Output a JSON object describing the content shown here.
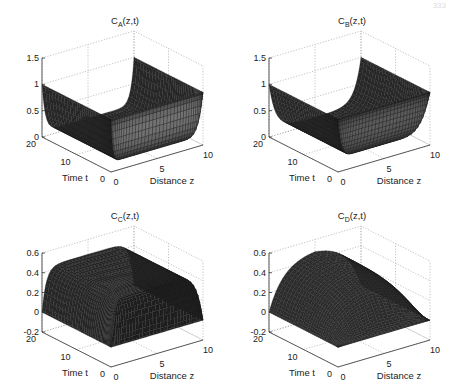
{
  "figure": {
    "page_number_fragment": "333"
  },
  "chart_data": [
    {
      "type": "surface3d",
      "panel": "A",
      "title": "C_A(z,t)",
      "title_main": "C",
      "title_sub": "A",
      "title_rest": "(z,t)",
      "xlabel": "Distance z",
      "ylabel": "Time t",
      "zlabel": "",
      "x_ticks": [
        0,
        5,
        10
      ],
      "y_ticks": [
        0,
        10,
        20
      ],
      "z_ticks": [
        "0",
        "0.5",
        "1",
        "1.5"
      ],
      "zlim": [
        0,
        1.5
      ],
      "xlim": [
        0,
        10
      ],
      "ylim": [
        0,
        20
      ],
      "grid": true,
      "description": "Boundary value 1 at t=0 edges; surface drops quickly to ~0.1 plateau in interior",
      "samples": {
        "boundary": 1.0,
        "interior": 0.1
      }
    },
    {
      "type": "surface3d",
      "panel": "B",
      "title": "C_B(z,t)",
      "title_main": "C",
      "title_sub": "B",
      "title_rest": "(z,t)",
      "xlabel": "Distance z",
      "ylabel": "Time t",
      "zlabel": "",
      "x_ticks": [
        0,
        5,
        10
      ],
      "y_ticks": [
        0,
        10,
        20
      ],
      "z_ticks": [
        "0",
        "0.5",
        "1",
        "1.5"
      ],
      "zlim": [
        0,
        1.5
      ],
      "xlim": [
        0,
        10
      ],
      "ylim": [
        0,
        20
      ],
      "grid": true,
      "description": "Boundary value 1; smoother decay toward ~0.1 interior plateau",
      "samples": {
        "boundary": 1.0,
        "interior": 0.12
      }
    },
    {
      "type": "surface3d",
      "panel": "C",
      "title": "C_C(z,t)",
      "title_main": "C",
      "title_sub": "C",
      "title_rest": "(z,t)",
      "xlabel": "Distance z",
      "ylabel": "Time t",
      "zlabel": "",
      "x_ticks": [
        0,
        5,
        10
      ],
      "y_ticks": [
        0,
        10,
        20
      ],
      "z_ticks": [
        "-0.2",
        "0",
        "0.2",
        "0.4",
        "0.6"
      ],
      "zlim": [
        -0.2,
        0.6
      ],
      "xlim": [
        0,
        10
      ],
      "ylim": [
        0,
        20
      ],
      "grid": true,
      "description": "Boundary value 0; quickly rises to ~0.45 plateau in interior",
      "samples": {
        "boundary": 0.0,
        "interior": 0.45
      }
    },
    {
      "type": "surface3d",
      "panel": "D",
      "title": "C_D(z,t)",
      "title_main": "C",
      "title_sub": "D",
      "title_rest": "(z,t)",
      "xlabel": "Distance z",
      "ylabel": "Time t",
      "zlabel": "",
      "x_ticks": [
        0,
        5,
        10
      ],
      "y_ticks": [
        0,
        10,
        20
      ],
      "z_ticks": [
        "-0.2",
        "0",
        "0.2",
        "0.4",
        "0.6"
      ],
      "zlim": [
        -0.2,
        0.6
      ],
      "xlim": [
        0,
        10
      ],
      "ylim": [
        0,
        20
      ],
      "grid": true,
      "description": "Boundary value 0; gradual dome rising to ~0.5 at center",
      "samples": {
        "boundary": 0.0,
        "interior": 0.5
      }
    }
  ]
}
